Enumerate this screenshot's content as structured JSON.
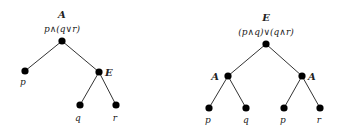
{
  "trees": [
    {
      "root_label": "A",
      "formula": "p∧(q∨r)",
      "nodes": [
        {
          "id": "root",
          "label": ""
        },
        {
          "id": "p",
          "label": "p"
        },
        {
          "id": "E",
          "label": "E"
        },
        {
          "id": "q",
          "label": "q"
        },
        {
          "id": "r",
          "label": "r"
        }
      ],
      "edges": [
        [
          "root",
          "p"
        ],
        [
          "root",
          "E"
        ],
        [
          "E",
          "q"
        ],
        [
          "E",
          "r"
        ]
      ]
    },
    {
      "root_label": "E",
      "formula": "(p∧q)∨(q∧r)",
      "nodes": [
        {
          "id": "root",
          "label": ""
        },
        {
          "id": "A1",
          "label": "A"
        },
        {
          "id": "A2",
          "label": "A"
        },
        {
          "id": "p1",
          "label": "p"
        },
        {
          "id": "q1",
          "label": "q"
        },
        {
          "id": "p2",
          "label": "p"
        },
        {
          "id": "r2",
          "label": "r"
        }
      ],
      "edges": [
        [
          "root",
          "A1"
        ],
        [
          "root",
          "A2"
        ],
        [
          "A1",
          "p1"
        ],
        [
          "A1",
          "q1"
        ],
        [
          "A2",
          "p2"
        ],
        [
          "A2",
          "r2"
        ]
      ]
    }
  ]
}
